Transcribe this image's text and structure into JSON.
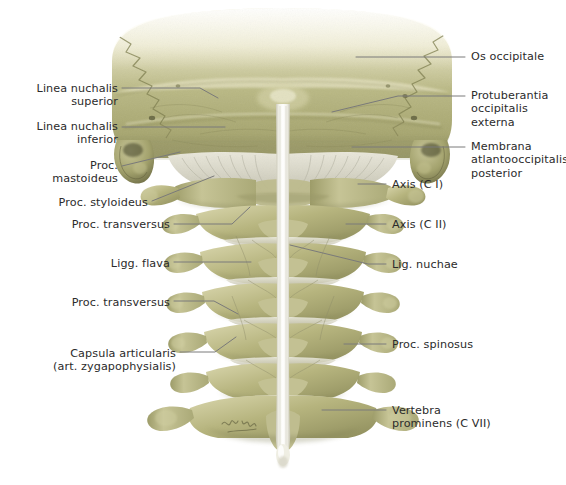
{
  "figure": {
    "background_color": "#ffffff",
    "text_color": "#2b2b2b",
    "leader_color": "#7a7a7a",
    "bone_color": "#a9a873",
    "bone_light_color": "#e8e6cd",
    "ligament_color": "#dedcd0",
    "signature": "K. Wesker"
  },
  "labels_left": [
    {
      "id": "linea-nuchalis-superior",
      "text": "Linea nuchalis\nsuperior",
      "x": 14,
      "y": 82,
      "w": 104
    },
    {
      "id": "linea-nuchalis-inferior",
      "text": "Linea nuchalis\ninferior",
      "x": 14,
      "y": 120,
      "w": 104
    },
    {
      "id": "proc-mastoideus",
      "text": "Proc.\nmastoideus",
      "x": 34,
      "y": 159,
      "w": 84
    },
    {
      "id": "proc-styloideus",
      "text": "Proc. styloideus",
      "x": 30,
      "y": 196,
      "w": 118
    },
    {
      "id": "proc-transversus-upper",
      "text": "Proc. transversus",
      "x": 52,
      "y": 218,
      "w": 118
    },
    {
      "id": "ligg-flava",
      "text": "Ligg. flava",
      "x": 108,
      "y": 257,
      "w": 62
    },
    {
      "id": "proc-transversus-lower",
      "text": "Proc. transversus",
      "x": 52,
      "y": 296,
      "w": 118
    },
    {
      "id": "capsula-articularis",
      "text": "Capsula articularis\n(art. zygapophysialis)",
      "x": 38,
      "y": 347,
      "w": 138
    }
  ],
  "labels_right": [
    {
      "id": "os-occipitale",
      "text": "Os occipitale",
      "x": 471,
      "y": 50
    },
    {
      "id": "protuberantia-occipitalis",
      "text": "Protuberantia\noccipitalis\nexterna",
      "x": 471,
      "y": 89
    },
    {
      "id": "membrana-atlantooccipitalis",
      "text": "Membrana\natlantooccipitalis\nposterior",
      "x": 471,
      "y": 140
    },
    {
      "id": "axis-c1",
      "text": "Axis (C I)",
      "x": 392,
      "y": 178
    },
    {
      "id": "axis-c2",
      "text": "Axis (C II)",
      "x": 392,
      "y": 218
    },
    {
      "id": "lig-nuchae",
      "text": "Lig. nuchae",
      "x": 392,
      "y": 258
    },
    {
      "id": "proc-spinosus",
      "text": "Proc. spinosus",
      "x": 392,
      "y": 338
    },
    {
      "id": "vertebra-prominens",
      "text": "Vertebra\nprominens (C VII)",
      "x": 392,
      "y": 404
    }
  ],
  "leader_lines": [
    {
      "id": "leader-linea-nuchalis-superior",
      "points": "122,88 200,88 218,98"
    },
    {
      "id": "leader-linea-nuchalis-inferior",
      "points": "122,127 225,127"
    },
    {
      "id": "leader-proc-mastoideus",
      "points": "122,166 180,152"
    },
    {
      "id": "leader-proc-styloideus",
      "points": "152,201 214,176"
    },
    {
      "id": "leader-proc-transversus-upper",
      "points": "174,224 232,224 250,207"
    },
    {
      "id": "leader-ligg-flava",
      "points": "174,262 251,262"
    },
    {
      "id": "leader-proc-transversus-lower",
      "points": "174,301 214,301 238,314"
    },
    {
      "id": "leader-capsula-articularis",
      "points": "180,352 215,352 236,337"
    },
    {
      "id": "leader-os-occipitale",
      "points": "465,57 356,57"
    },
    {
      "id": "leader-protuberantia",
      "points": "465,96 398,96 332,112"
    },
    {
      "id": "leader-membrana",
      "points": "465,147 352,147"
    },
    {
      "id": "leader-axis-c1",
      "points": "386,184 358,184"
    },
    {
      "id": "leader-axis-c2",
      "points": "386,224 346,224"
    },
    {
      "id": "leader-lig-nuchae",
      "points": "386,264 368,264 290,245"
    },
    {
      "id": "leader-proc-spinosus",
      "points": "386,344 344,344"
    },
    {
      "id": "leader-vertebra-prominens",
      "points": "386,410 322,410"
    }
  ]
}
